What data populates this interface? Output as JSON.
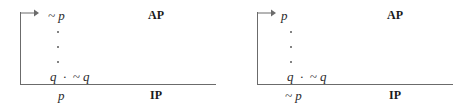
{
  "figure": {
    "line_color": "#6b6b6b",
    "text_color": "#2b2b2b",
    "panels": [
      {
        "id": "left",
        "arrow_icon": "assumption-arrow-icon",
        "assumption": "~ p",
        "ellipsis_dots": 3,
        "contradiction": "q  ·  ~ q",
        "conclusion": "p",
        "top_tag": "AP",
        "bottom_tag": "IP"
      },
      {
        "id": "right",
        "arrow_icon": "assumption-arrow-icon",
        "assumption": "p",
        "ellipsis_dots": 3,
        "contradiction": "q  ·  ~ q",
        "conclusion": "~ p",
        "top_tag": "AP",
        "bottom_tag": "IP"
      }
    ]
  }
}
